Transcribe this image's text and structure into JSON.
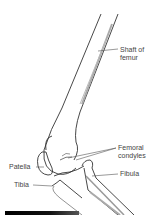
{
  "diagram": {
    "labels": {
      "shaft_line1": "Shaft of",
      "shaft_line2": "femur",
      "condyles_line1": "Femoral",
      "condyles_line2": "condyles",
      "patella": "Patella",
      "fibula": "Fibula",
      "tibia": "Tibia"
    },
    "colors": {
      "line": "#333333",
      "shade": "#9a9a9a",
      "label": "#444444"
    }
  }
}
